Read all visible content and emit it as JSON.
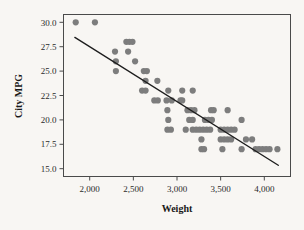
{
  "chart_data": {
    "type": "scatter",
    "title": "",
    "xlabel": "Weight",
    "ylabel": "City MPG",
    "xlim": [
      1700,
      4300
    ],
    "ylim": [
      14.2,
      30.8
    ],
    "grid": false,
    "legend": null,
    "x_ticks": [
      2000,
      2500,
      3000,
      3500,
      4000
    ],
    "x_tick_labels": [
      "2,000",
      "2,500",
      "3,000",
      "3,500",
      "4,000"
    ],
    "y_ticks": [
      15.0,
      17.5,
      20.0,
      22.5,
      25.0,
      27.5,
      30.0
    ],
    "y_tick_labels": [
      "15.0",
      "17.5",
      "20.0",
      "22.5",
      "25.0",
      "27.5",
      "30.0"
    ],
    "marker_color": "#7d7d7d",
    "marker_size": 3.1,
    "fit_line": {
      "label": "linear fit",
      "color": "#1d1d1d",
      "x_start": 1830,
      "y_start": 28.45,
      "x_end": 4160,
      "y_end": 15.35
    },
    "points": [
      [
        1840,
        30.0
      ],
      [
        2060,
        30.0
      ],
      [
        2420,
        28.0
      ],
      [
        2455,
        28.0
      ],
      [
        2490,
        28.0
      ],
      [
        2290,
        27.0
      ],
      [
        2440,
        27.0
      ],
      [
        2300,
        26.0
      ],
      [
        2520,
        26.0
      ],
      [
        2300,
        25.0
      ],
      [
        2620,
        25.0
      ],
      [
        2655,
        25.0
      ],
      [
        2640,
        24.0
      ],
      [
        2775,
        24.0
      ],
      [
        2600,
        23.0
      ],
      [
        2640,
        23.0
      ],
      [
        2900,
        23.0
      ],
      [
        3060,
        23.0
      ],
      [
        3180,
        23.0
      ],
      [
        2740,
        22.0
      ],
      [
        2780,
        22.0
      ],
      [
        2880,
        22.0
      ],
      [
        2940,
        22.0
      ],
      [
        3040,
        22.0
      ],
      [
        3060,
        22.0
      ],
      [
        2890,
        21.0
      ],
      [
        3120,
        21.0
      ],
      [
        3160,
        21.0
      ],
      [
        3200,
        21.0
      ],
      [
        3390,
        21.0
      ],
      [
        3420,
        21.0
      ],
      [
        3580,
        21.0
      ],
      [
        2900,
        20.0
      ],
      [
        3140,
        20.0
      ],
      [
        3180,
        20.0
      ],
      [
        3320,
        20.0
      ],
      [
        3360,
        20.0
      ],
      [
        3400,
        20.0
      ],
      [
        3740,
        20.0
      ],
      [
        2890,
        19.0
      ],
      [
        2930,
        19.0
      ],
      [
        3100,
        19.0
      ],
      [
        3180,
        19.0
      ],
      [
        3220,
        19.0
      ],
      [
        3260,
        19.0
      ],
      [
        3300,
        19.0
      ],
      [
        3340,
        19.0
      ],
      [
        3380,
        19.0
      ],
      [
        3500,
        19.0
      ],
      [
        3540,
        19.0
      ],
      [
        3580,
        19.0
      ],
      [
        3620,
        19.0
      ],
      [
        3660,
        19.0
      ],
      [
        3280,
        18.0
      ],
      [
        3500,
        18.0
      ],
      [
        3540,
        18.0
      ],
      [
        3580,
        18.0
      ],
      [
        3620,
        18.0
      ],
      [
        3790,
        18.0
      ],
      [
        3860,
        18.0
      ],
      [
        3280,
        17.0
      ],
      [
        3310,
        17.0
      ],
      [
        3520,
        17.0
      ],
      [
        3740,
        17.0
      ],
      [
        3900,
        17.0
      ],
      [
        3940,
        17.0
      ],
      [
        3980,
        17.0
      ],
      [
        4020,
        17.0
      ],
      [
        4060,
        17.0
      ],
      [
        4150,
        17.0
      ]
    ]
  },
  "axes": {
    "y_axis_title": "City MPG",
    "x_axis_title": "Weight"
  }
}
